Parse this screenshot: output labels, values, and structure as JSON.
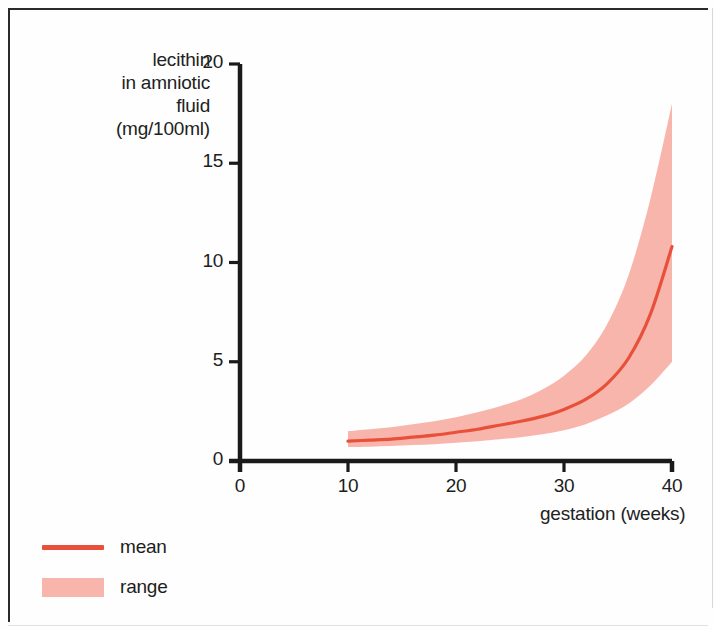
{
  "chart_data": {
    "type": "area",
    "title": "",
    "xlabel": "gestation (weeks)",
    "ylabel": "lecithin in amniotic fluid (mg/100ml)",
    "ylabel_lines": [
      "lecithin",
      "in amniotic",
      "fluid",
      "(mg/100ml)"
    ],
    "xlim": [
      0,
      40
    ],
    "ylim": [
      0,
      20
    ],
    "xticks": [
      0,
      10,
      20,
      30,
      40
    ],
    "yticks": [
      0,
      5,
      10,
      15,
      20
    ],
    "xtick_labels": [
      "0",
      "10",
      "20",
      "30",
      "40"
    ],
    "ytick_labels": [
      "0",
      "5",
      "10",
      "15",
      "20"
    ],
    "grid": false,
    "legend_position": "bottom-left",
    "x": [
      10,
      12,
      14,
      16,
      18,
      20,
      22,
      24,
      26,
      28,
      30,
      32,
      34,
      36,
      38,
      40
    ],
    "series": [
      {
        "name": "mean",
        "type": "line",
        "color": "#e8503a",
        "values": [
          1.0,
          1.05,
          1.1,
          1.2,
          1.3,
          1.45,
          1.6,
          1.8,
          2.0,
          2.25,
          2.6,
          3.1,
          3.9,
          5.2,
          7.4,
          10.8
        ]
      },
      {
        "name": "range",
        "type": "band",
        "color": "#f8b5ac",
        "upper": [
          1.5,
          1.6,
          1.7,
          1.85,
          2.0,
          2.2,
          2.45,
          2.75,
          3.1,
          3.6,
          4.3,
          5.3,
          6.9,
          9.4,
          13.2,
          18.0
        ],
        "lower": [
          0.7,
          0.72,
          0.75,
          0.8,
          0.85,
          0.92,
          1.0,
          1.1,
          1.2,
          1.35,
          1.55,
          1.85,
          2.3,
          2.9,
          3.8,
          5.0
        ]
      }
    ],
    "legend": [
      {
        "label": "mean",
        "kind": "line",
        "color": "#e8503a"
      },
      {
        "label": "range",
        "kind": "band",
        "color": "#f8b5ac"
      }
    ],
    "colors": {
      "mean_line": "#e8503a",
      "range_band": "#f8b5ac",
      "axis": "#1a1a1a",
      "text": "#1d1d1d",
      "background": "#fefefe",
      "frame": "#2a2a2a"
    }
  }
}
